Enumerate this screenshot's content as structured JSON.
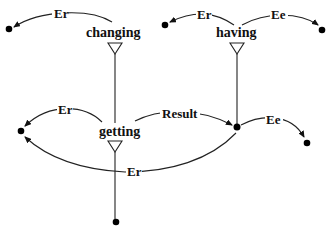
{
  "diagram": {
    "type": "semantic-role-graph",
    "nodes": [
      {
        "id": "changing",
        "label": "changing"
      },
      {
        "id": "having",
        "label": "having"
      },
      {
        "id": "getting",
        "label": "getting"
      }
    ],
    "edges": [
      {
        "from": "changing",
        "to": "entity-top-left",
        "label": "Er"
      },
      {
        "from": "having",
        "to": "entity-top-mid",
        "label": "Er"
      },
      {
        "from": "having",
        "to": "entity-top-right",
        "label": "Ee"
      },
      {
        "from": "getting",
        "to": "entity-mid-left",
        "label": "Er"
      },
      {
        "from": "getting",
        "to": "entity-mid-right",
        "label": "Result"
      },
      {
        "from": "entity-mid-right",
        "to": "entity-right",
        "label": "Ee"
      },
      {
        "from": "entity-mid-right",
        "to": "entity-mid-left",
        "label": "Er"
      }
    ],
    "labels": {
      "changing_er": "Er",
      "having_er": "Er",
      "having_ee": "Ee",
      "getting_er": "Er",
      "getting_result": "Result",
      "mid_ee": "Ee",
      "bottom_er": "Er"
    }
  }
}
